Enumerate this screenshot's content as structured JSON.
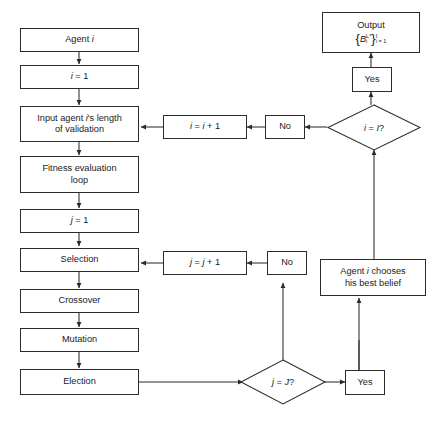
{
  "diagram": {
    "type": "flowchart",
    "line_color": "#2b2b2b",
    "text_color": "#1a1a1a",
    "background": "#ffffff",
    "nodes": [
      {
        "id": "agent_i",
        "shape": "rect",
        "label": "Agent i"
      },
      {
        "id": "i_init",
        "shape": "rect",
        "label": "i = 1"
      },
      {
        "id": "input_len",
        "shape": "rect",
        "label": "Input agent i's length\nof validation"
      },
      {
        "id": "fitness",
        "shape": "rect",
        "label": "Fitness evaluation\nloop"
      },
      {
        "id": "j_init",
        "shape": "rect",
        "label": "j = 1"
      },
      {
        "id": "selection",
        "shape": "rect",
        "label": "Selection"
      },
      {
        "id": "crossover",
        "shape": "rect",
        "label": "Crossover"
      },
      {
        "id": "mutation",
        "shape": "rect",
        "label": "Mutation"
      },
      {
        "id": "election",
        "shape": "rect",
        "label": "Election"
      },
      {
        "id": "i_incr",
        "shape": "rect",
        "label": "i = i + 1"
      },
      {
        "id": "j_incr",
        "shape": "rect",
        "label": "j = j + 1"
      },
      {
        "id": "no_outer",
        "shape": "rect",
        "label": "No"
      },
      {
        "id": "no_inner",
        "shape": "rect",
        "label": "No"
      },
      {
        "id": "yes_outer",
        "shape": "rect",
        "label": "Yes"
      },
      {
        "id": "yes_inner",
        "shape": "rect",
        "label": "Yes"
      },
      {
        "id": "best_belief",
        "shape": "rect",
        "label": "Agent i chooses\nhis best belief"
      },
      {
        "id": "decide_i",
        "shape": "diamond",
        "label": "i = I?"
      },
      {
        "id": "decide_j",
        "shape": "diamond",
        "label": "j = J?"
      },
      {
        "id": "output",
        "shape": "rect",
        "label": "Output"
      }
    ],
    "output_formula": {
      "open_brace": "{",
      "symbol": "B",
      "superscript": "L*",
      "subscript": "i",
      "close_brace": "}",
      "upper_limit": "I",
      "lower_limit": "i = 1",
      "plain_text": "{B_i^{L*}}_{i=1}^{I}"
    },
    "edges": [
      {
        "from": "agent_i",
        "to": "i_init",
        "label": ""
      },
      {
        "from": "i_init",
        "to": "input_len",
        "label": ""
      },
      {
        "from": "input_len",
        "to": "fitness",
        "label": ""
      },
      {
        "from": "fitness",
        "to": "j_init",
        "label": ""
      },
      {
        "from": "j_init",
        "to": "selection",
        "label": ""
      },
      {
        "from": "selection",
        "to": "crossover",
        "label": ""
      },
      {
        "from": "crossover",
        "to": "mutation",
        "label": ""
      },
      {
        "from": "mutation",
        "to": "election",
        "label": ""
      },
      {
        "from": "election",
        "to": "decide_j",
        "label": ""
      },
      {
        "from": "decide_j",
        "to": "no_inner",
        "label": "No"
      },
      {
        "from": "no_inner",
        "to": "j_incr",
        "label": ""
      },
      {
        "from": "j_incr",
        "to": "selection",
        "label": ""
      },
      {
        "from": "decide_j",
        "to": "yes_inner",
        "label": "Yes"
      },
      {
        "from": "yes_inner",
        "to": "best_belief",
        "label": ""
      },
      {
        "from": "best_belief",
        "to": "decide_i",
        "label": ""
      },
      {
        "from": "decide_i",
        "to": "no_outer",
        "label": "No"
      },
      {
        "from": "no_outer",
        "to": "i_incr",
        "label": ""
      },
      {
        "from": "i_incr",
        "to": "input_len",
        "label": ""
      },
      {
        "from": "decide_i",
        "to": "yes_outer",
        "label": "Yes"
      },
      {
        "from": "yes_outer",
        "to": "output",
        "label": ""
      }
    ]
  }
}
